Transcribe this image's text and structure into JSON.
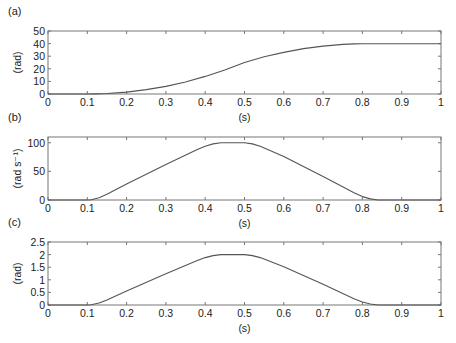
{
  "figure": {
    "panels": [
      {
        "id": "a",
        "label": "(a)",
        "ylabel": "(rad)",
        "xlabel": "(s)"
      },
      {
        "id": "b",
        "label": "(b)",
        "ylabel": "(rad s⁻¹)",
        "xlabel": "(s)"
      },
      {
        "id": "c",
        "label": "(c)",
        "ylabel": "(rad)",
        "xlabel": "(s)"
      }
    ]
  },
  "colors": {
    "line": "#555555",
    "axis": "#777777",
    "text": "#222222",
    "background": "#ffffff"
  },
  "chart_data": [
    {
      "type": "line",
      "title": "(a)",
      "xlabel": "(s)",
      "ylabel": "(rad)",
      "xlim": [
        0,
        1
      ],
      "ylim": [
        0,
        50
      ],
      "xticks": [
        0,
        0.1,
        0.2,
        0.3,
        0.4,
        0.5,
        0.6,
        0.7,
        0.8,
        0.9,
        1
      ],
      "xtick_labels": [
        "0",
        "0.1",
        "0.2",
        "0.3",
        "0.4",
        "0.5",
        "0.6",
        "0.7",
        "0.8",
        "0.9",
        "1"
      ],
      "yticks": [
        0,
        10,
        20,
        30,
        40,
        50
      ],
      "ytick_labels": [
        "0",
        "10",
        "20",
        "30",
        "40",
        "50"
      ],
      "grid": false,
      "legend": null,
      "series": [
        {
          "name": "position",
          "x": [
            0,
            0.1,
            0.12,
            0.15,
            0.2,
            0.25,
            0.3,
            0.35,
            0.4,
            0.45,
            0.5,
            0.55,
            0.6,
            0.65,
            0.7,
            0.75,
            0.78,
            0.8,
            0.9,
            1.0
          ],
          "values": [
            0,
            0,
            0.05,
            0.4,
            1.5,
            3.5,
            6,
            9.5,
            14,
            19,
            25,
            29.5,
            33,
            36,
            38,
            39.4,
            39.8,
            39.9,
            39.9,
            39.9
          ]
        }
      ]
    },
    {
      "type": "line",
      "title": "(b)",
      "xlabel": "(s)",
      "ylabel": "(rad s⁻¹)",
      "xlim": [
        0,
        1
      ],
      "ylim": [
        0,
        110
      ],
      "xticks": [
        0,
        0.1,
        0.2,
        0.3,
        0.4,
        0.5,
        0.6,
        0.7,
        0.8,
        0.9,
        1
      ],
      "xtick_labels": [
        "0",
        "0.1",
        "0.2",
        "0.3",
        "0.4",
        "0.5",
        "0.6",
        "0.7",
        "0.8",
        "0.9",
        "1"
      ],
      "yticks": [
        0,
        50,
        100
      ],
      "ytick_labels": [
        "0",
        "50",
        "100"
      ],
      "grid": false,
      "legend": null,
      "series": [
        {
          "name": "velocity",
          "x": [
            0,
            0.1,
            0.11,
            0.13,
            0.15,
            0.2,
            0.3,
            0.38,
            0.4,
            0.42,
            0.44,
            0.5,
            0.52,
            0.54,
            0.6,
            0.7,
            0.78,
            0.8,
            0.82,
            0.84,
            0.9,
            1.0
          ],
          "values": [
            0,
            0,
            0.5,
            4,
            10,
            28,
            62,
            88,
            94,
            98,
            100,
            100,
            98,
            94,
            76,
            41,
            12,
            6,
            2,
            0,
            0,
            0
          ]
        }
      ]
    },
    {
      "type": "line",
      "title": "(c)",
      "xlabel": "(s)",
      "ylabel": "(rad)",
      "xlim": [
        0,
        1
      ],
      "ylim": [
        0,
        2.5
      ],
      "xticks": [
        0,
        0.1,
        0.2,
        0.3,
        0.4,
        0.5,
        0.6,
        0.7,
        0.8,
        0.9,
        1
      ],
      "xtick_labels": [
        "0",
        "0.1",
        "0.2",
        "0.3",
        "0.4",
        "0.5",
        "0.6",
        "0.7",
        "0.8",
        "0.9",
        "1"
      ],
      "yticks": [
        0,
        0.5,
        1,
        1.5,
        2,
        2.5
      ],
      "ytick_labels": [
        "0",
        "0.5",
        "1",
        "1.5",
        "2",
        "2.5"
      ],
      "grid": false,
      "legend": null,
      "series": [
        {
          "name": "angle",
          "x": [
            0,
            0.1,
            0.11,
            0.13,
            0.15,
            0.2,
            0.3,
            0.38,
            0.4,
            0.42,
            0.44,
            0.5,
            0.52,
            0.54,
            0.6,
            0.7,
            0.78,
            0.8,
            0.82,
            0.84,
            0.9,
            1.0
          ],
          "values": [
            0,
            0,
            0.01,
            0.08,
            0.2,
            0.56,
            1.24,
            1.76,
            1.88,
            1.96,
            2.0,
            2.0,
            1.96,
            1.88,
            1.52,
            0.82,
            0.24,
            0.12,
            0.04,
            0,
            0,
            0
          ]
        }
      ]
    }
  ]
}
